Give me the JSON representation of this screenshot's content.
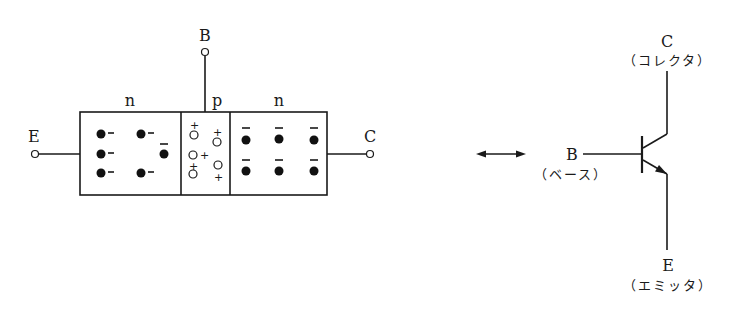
{
  "structure": {
    "regions": [
      {
        "label": "n",
        "type": "emitter-region"
      },
      {
        "label": "p",
        "type": "base-region"
      },
      {
        "label": "n",
        "type": "collector-region"
      }
    ],
    "terminals": {
      "emitter": "E",
      "base": "B",
      "collector": "C"
    },
    "electron_sign": "−",
    "hole_sign": "+"
  },
  "symbol": {
    "collector": {
      "letter": "C",
      "name": "（コレクタ）"
    },
    "base": {
      "letter": "B",
      "name": "（ベース）"
    },
    "emitter": {
      "letter": "E",
      "name": "（エミッタ）"
    },
    "equivalence": "double-arrow"
  }
}
